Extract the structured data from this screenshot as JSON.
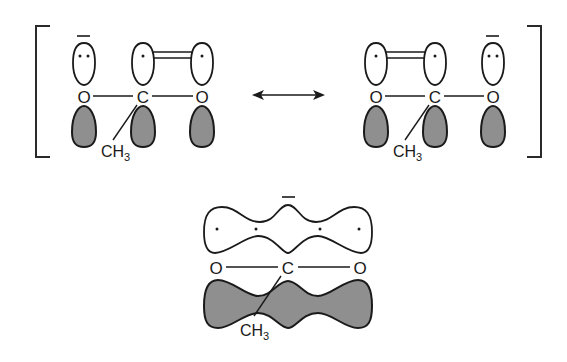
{
  "diagram": {
    "title": "",
    "type": "resonance-orbital-diagram",
    "resonance_structures": [
      {
        "atoms": [
          {
            "label": "O",
            "charge": "−",
            "lone_electrons": 2
          },
          {
            "label": "C",
            "substituent": "CH3",
            "lone_electrons": 1
          },
          {
            "label": "O",
            "lone_electrons": 1
          }
        ],
        "pi_bond": "C=O (right)"
      },
      {
        "atoms": [
          {
            "label": "O",
            "lone_electrons": 1
          },
          {
            "label": "C",
            "substituent": "CH3",
            "lone_electrons": 1
          },
          {
            "label": "O",
            "charge": "−",
            "lone_electrons": 2
          }
        ],
        "pi_bond": "O=C (left)"
      }
    ],
    "resonance_arrow": "double-headed",
    "hybrid": {
      "atoms": [
        "O",
        "C",
        "O"
      ],
      "substituent": "CH3",
      "charge": "−",
      "delocalized_electrons": 4
    },
    "labels": {
      "O": "O",
      "C": "C",
      "CH": "CH",
      "sub3": "3"
    },
    "colors": {
      "shaded_lobe": "#8f8f8f",
      "outline": "#1a1a1a",
      "background": "#ffffff"
    }
  }
}
